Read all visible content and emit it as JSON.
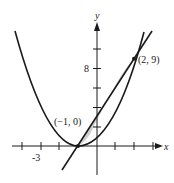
{
  "figure": {
    "axes": {
      "x_label": "x",
      "y_label": "y",
      "x_tick_label": "-3",
      "y_tick_label": "8",
      "x_ticks": [
        -4,
        -3,
        -2,
        -1,
        1,
        2,
        3
      ],
      "y_ticks": [
        2,
        4,
        6,
        8,
        10
      ]
    },
    "curves": [
      {
        "name": "parabola",
        "equation": "y = (x + 1)^2"
      },
      {
        "name": "line",
        "equation": "y = 3(x + 1)"
      }
    ],
    "points": [
      {
        "label": "(−1, 0)",
        "x": -1,
        "y": 0
      },
      {
        "label": "(2, 9)",
        "x": 2,
        "y": 9
      }
    ],
    "shaded_region": "between line and parabola from x = -1 to x = 2",
    "colors": {
      "stroke": "#1a1a1a",
      "shade": "#d0d0d0"
    }
  }
}
